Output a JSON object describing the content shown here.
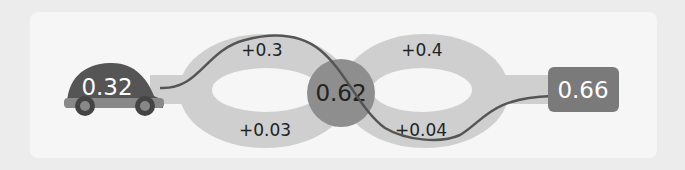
{
  "start": {
    "value": "0.32",
    "icon": "car-icon"
  },
  "center": {
    "value": "0.62"
  },
  "end": {
    "value": "0.66"
  },
  "left_loop": {
    "top_delta": "+0.3",
    "bottom_delta": "+0.03"
  },
  "right_loop": {
    "top_delta": "+0.4",
    "bottom_delta": "+0.04"
  },
  "colors": {
    "background": "#ececec",
    "card": "#f6f6f6",
    "track": "#cfcfcf",
    "center_node": "#8e8e8e",
    "end_node": "#7a7a7a",
    "car_body": "#555555",
    "path_line": "#555555"
  }
}
